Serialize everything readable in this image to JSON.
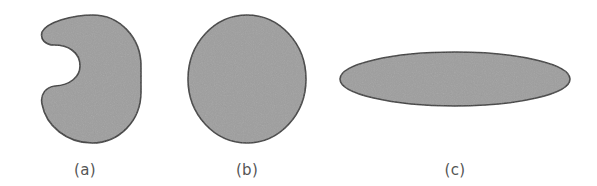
{
  "figure": {
    "background_color": "#ffffff",
    "width": 597,
    "height": 186,
    "fill_color": "#9e9e9e",
    "stroke_color": "#3a3a3a",
    "label_color": "#555555"
  },
  "panels": [
    {
      "id": "panel-a",
      "label": "(a)",
      "shape_name": "concave-bean-shape",
      "label_x": 85,
      "label_y": 163
    },
    {
      "id": "panel-b",
      "label": "(b)",
      "shape_name": "circle-shape",
      "label_x": 247,
      "label_y": 163
    },
    {
      "id": "panel-c",
      "label": "(c)",
      "shape_name": "flat-ellipse-shape",
      "label_x": 455,
      "label_y": 163
    }
  ],
  "geometry": {
    "concave_path": "M 93 15 C 119 15 141 37 141 66 L 141 92 C 141 121 119 143 92 143 C 67 143 46 126 42 104 C 40 94 46 87 55 86 C 70 85 80 77 80 66 C 80 52 68 45 54 45 C 45 45 40 39 42 32 C 47 22 72 15 93 15 Z",
    "circle": {
      "cx": 247,
      "cy": 79,
      "rx": 59,
      "ry": 64
    },
    "ellipse": {
      "cx": 455,
      "cy": 79,
      "rx": 115,
      "ry": 27
    }
  }
}
